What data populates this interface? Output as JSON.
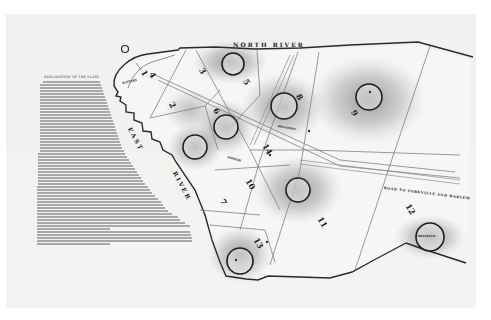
{
  "map": {
    "title": "Map of the City of New York",
    "explanation": {
      "heading": "EXPLANATION OF THE PLATE",
      "paragraphs_visible": true
    },
    "water_labels": [
      {
        "id": "north-river",
        "text": "NORTH RIVER"
      },
      {
        "id": "east-river-1",
        "text": "EAST"
      },
      {
        "id": "east-river-2",
        "text": "RIVER"
      }
    ],
    "road_labels": [
      {
        "id": "road-yorkville",
        "text": "ROAD TO YORKVILLE AND HARLEM"
      },
      {
        "id": "broadway",
        "text": "BROADWAY"
      },
      {
        "id": "battery",
        "text": "BATTERY"
      },
      {
        "id": "bowery",
        "text": "BOWERY"
      }
    ],
    "wards": [
      "1",
      "2",
      "3",
      "4",
      "5",
      "6",
      "7",
      "8",
      "9",
      "10",
      "11",
      "12",
      "13",
      "14"
    ],
    "marked_sites": [
      {
        "id": "site-ward-3",
        "label": ""
      },
      {
        "id": "site-ward-4",
        "label": ""
      },
      {
        "id": "site-ward-6",
        "label": ""
      },
      {
        "id": "site-ward-8",
        "label": ""
      },
      {
        "id": "site-ward-9",
        "label": ""
      },
      {
        "id": "site-ward-11",
        "label": ""
      },
      {
        "id": "site-ward-13",
        "label": ""
      },
      {
        "id": "site-ward-12",
        "label": "BELLEVUE"
      }
    ],
    "colors": {
      "paper": "#f1f1f0",
      "ink": "#222222",
      "hatching": "#8a8a8a"
    }
  }
}
